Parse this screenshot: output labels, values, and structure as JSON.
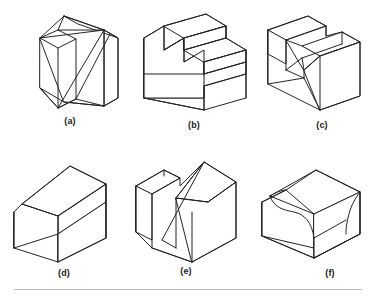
{
  "plate": {
    "title": "Isometric views of six machined solid blocks",
    "background_color": "#ffffff",
    "line_color": "#232323",
    "rule_color": "#b9b9b9",
    "label_color": "#1a1a1a"
  },
  "figures": [
    {
      "id": "a",
      "label": "(a)",
      "description": "Inclined wedge block with a diagonal rib across the sloping face",
      "row": 1,
      "column": 1
    },
    {
      "id": "b",
      "label": "(b)",
      "description": "Three-step staircase block",
      "row": 1,
      "column": 2
    },
    {
      "id": "c",
      "label": "(c)",
      "description": "U-shaped block with a central through slot",
      "row": 1,
      "column": 3
    },
    {
      "id": "d",
      "label": "(d)",
      "description": "House-shaped block with chamfered gable roof",
      "row": 2,
      "column": 1
    },
    {
      "id": "e",
      "label": "(e)",
      "description": "Block with an angled tapered slot cut through the top",
      "row": 2,
      "column": 2
    },
    {
      "id": "f",
      "label": "(f)",
      "description": "Block with concave filleted step and rounded corner",
      "row": 2,
      "column": 3
    }
  ],
  "footer": {
    "rule_visible": true
  }
}
